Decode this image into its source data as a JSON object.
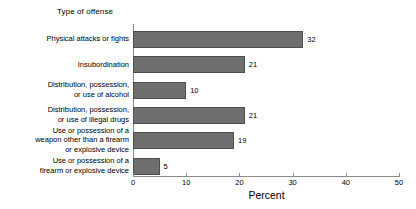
{
  "chart_data": {
    "type": "bar",
    "orientation": "horizontal",
    "title": "",
    "group_title": "Type of offense",
    "xlabel": "Percent",
    "ylabel": "",
    "categories": [
      "Physical attacks or fights",
      "Insubordination",
      "Distribution, possession,\nor use of alcohol",
      "Distribution, possession,\nor use of illegal drugs",
      "Use or possession of a\nweapon other than a firearm\nor explosive device",
      "Use or possession of a\nfirearm or explosive device"
    ],
    "values": [
      32,
      21,
      10,
      21,
      19,
      5
    ],
    "value_labels": [
      "32",
      "21",
      "10",
      "21",
      "19",
      "5"
    ],
    "xlim": [
      0,
      50
    ],
    "xticks": [
      0,
      10,
      20,
      30,
      40,
      50
    ],
    "xtick_labels": [
      "0",
      "10",
      "20",
      "30",
      "40",
      "50"
    ],
    "grid": false,
    "legend": false,
    "bar_color": "#6f6f6f",
    "bar_edge_color": "#4f4f4f",
    "axis_color": "#8a8a8a",
    "background": "#ffffff"
  }
}
